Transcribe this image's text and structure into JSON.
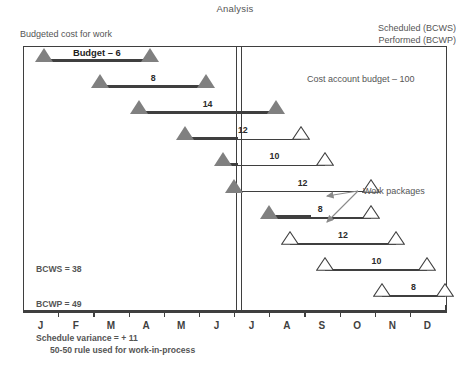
{
  "title": "Analysis",
  "header": {
    "left": "Budgeted cost for work",
    "right_line1": "Scheduled (BCWS)",
    "right_line2": "Performed (BCWP)"
  },
  "cost_account_budget": "Cost account budget – 100",
  "budget_label": "Budget – 6",
  "work_packages_label": "Work packages",
  "footnote": "50-50 rule used for work-in-process",
  "notes": {
    "bcws": "BCWS = 38",
    "bcwp": "BCWP = 49",
    "variance": "Schedule variance = + 11"
  },
  "colors": {
    "filled_triangle": "#808080",
    "line": "#3f3f3f",
    "text": "#555555"
  },
  "axis": {
    "months": [
      "J",
      "F",
      "M",
      "A",
      "M",
      "J",
      "J",
      "A",
      "S",
      "O",
      "N",
      "D"
    ]
  },
  "chart_data": {
    "type": "bar",
    "title": "Analysis",
    "xlabel": "",
    "ylabel": "",
    "categories": [
      "J",
      "F",
      "M",
      "A",
      "M",
      "J",
      "J",
      "A",
      "S",
      "O",
      "N",
      "D"
    ],
    "status_date_month": 6.4,
    "cost_account_budget": 100,
    "totals": {
      "BCWS": 38,
      "BCWP": 49,
      "schedule_variance": 11
    },
    "rule": "50-50 rule used for work-in-process",
    "work_packages": [
      {
        "id": 1,
        "value": 6,
        "start_month": 0.6,
        "end_month": 3.6,
        "state": "complete",
        "start_marker": "filled",
        "end_marker": "filled",
        "label": "Budget – 6"
      },
      {
        "id": 2,
        "value": 8,
        "start_month": 2.2,
        "end_month": 5.2,
        "state": "complete",
        "start_marker": "filled",
        "end_marker": "filled",
        "label": "8"
      },
      {
        "id": 3,
        "value": 14,
        "start_month": 3.3,
        "end_month": 7.2,
        "state": "complete",
        "start_marker": "filled",
        "end_marker": "filled",
        "label": "14"
      },
      {
        "id": 4,
        "value": 12,
        "start_month": 4.6,
        "end_month": 7.9,
        "state": "in-process",
        "start_marker": "filled",
        "end_marker": "open",
        "label": "12"
      },
      {
        "id": 5,
        "value": 10,
        "start_month": 5.7,
        "end_month": 8.6,
        "state": "in-process",
        "start_marker": "filled",
        "end_marker": "open",
        "label": "10"
      },
      {
        "id": 6,
        "value": 12,
        "start_month": 6.0,
        "end_month": 9.9,
        "state": "in-process",
        "start_marker": "filled",
        "end_marker": "open",
        "label": "12"
      },
      {
        "id": 7,
        "value": 8,
        "start_month": 7.0,
        "end_month": 9.9,
        "state": "in-process",
        "start_marker": "filled",
        "end_marker": "open",
        "label": "8"
      },
      {
        "id": 8,
        "value": 12,
        "start_month": 7.6,
        "end_month": 10.6,
        "state": "scheduled",
        "start_marker": "open",
        "end_marker": "open",
        "label": "12"
      },
      {
        "id": 9,
        "value": 10,
        "start_month": 8.6,
        "end_month": 11.5,
        "state": "scheduled",
        "start_marker": "open",
        "end_marker": "open",
        "label": "10"
      },
      {
        "id": 10,
        "value": 8,
        "start_month": 10.2,
        "end_month": 12.0,
        "state": "scheduled",
        "start_marker": "open",
        "end_marker": "open",
        "label": "8"
      }
    ]
  }
}
